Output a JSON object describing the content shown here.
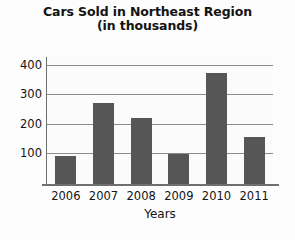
{
  "chart_data": {
    "type": "bar",
    "title": "Cars Sold in Northeast Region",
    "subtitle": "(in thousands)",
    "xlabel": "Years",
    "ylabel": "",
    "categories": [
      "2006",
      "2007",
      "2008",
      "2009",
      "2010",
      "2011"
    ],
    "values": [
      95,
      275,
      225,
      100,
      375,
      160
    ],
    "ylim": [
      0,
      430
    ],
    "yticks": [
      100,
      200,
      300,
      400
    ],
    "ytick_labels": [
      "100",
      "200",
      "300",
      "400"
    ],
    "grid": true,
    "legend": false,
    "bar_color": "#565656",
    "grid_color": "#8c8c8c",
    "axis_color": "#6f6f6f",
    "background_color": "#fdfdfd"
  }
}
